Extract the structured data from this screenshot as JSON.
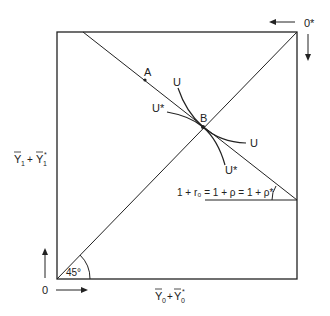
{
  "diagram": {
    "colors": {
      "line": "#222222",
      "background": "#ffffff"
    },
    "origin_label": "0",
    "foreign_origin_label": "0*",
    "y_axis_label": {
      "base": "Y",
      "sub1": "1",
      "plus": "+",
      "base2": "Y",
      "sub2": "1",
      "star": "*"
    },
    "x_axis_label": {
      "base": "Y",
      "sub1": "0",
      "plus": "+",
      "base2": "Y",
      "sub2": "0",
      "star": "*"
    },
    "angle_label": "45°",
    "point_a": "A",
    "point_b": "B",
    "curve_u_top": "U",
    "curve_ustar_left": "U*",
    "curve_u_right": "U",
    "curve_ustar_bottom": "U*",
    "price_line_label": "1 + r₀ = 1 + ρ = 1 + ρ*"
  }
}
